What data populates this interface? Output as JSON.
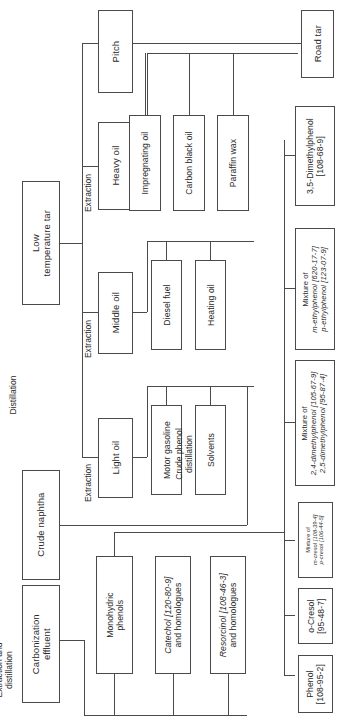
{
  "diagram": {
    "type": "process-flow",
    "orientation": "rotated-90-ccw"
  },
  "nodes": {
    "low_temperature_tar": "Low\ntemperature tar",
    "crude_naphtha": "Crude naphtha",
    "carbonization_effluent": "Carbonization\neffluent",
    "pitch": "Pitch",
    "heavy_oil": "Heavy oil",
    "middle_oil": "Middle oil",
    "light_oil": "Light oil",
    "road_tar": "Road tar",
    "impregnating_oil": "Impregnating oil",
    "carbon_black_oil": "Carbon black oil",
    "paraffin_wax": "Paraffin wax",
    "diesel_fuel": "Diesel fuel",
    "heating_oil": "Heating oil",
    "motor_gasoline": "Motor gasoline",
    "solvents": "Solvents",
    "monohydric_phenols": "Monohydric\nphenols",
    "catechol": "Catechol [120-80-9]\nand homologues",
    "resorcinol": "Resorcinol [108-46-3]\nand homologues",
    "dimethylphenol_35": "3,5-Dimethylphenol\n[108-68-9]",
    "mixture_ethylphenol": "Mixture of\nm-ethylphenol [620-17-7]\np-ethylphenol [123-07-9]",
    "mixture_dimethylphenol": "Mixture of\n2,4-dimethylphenol [105-67-9]\n2,5-dimethylphenol [95-87-4]",
    "mixture_cresol": "Mixture of\nm-cresol [108-39-4]\np-cresol [106-44-5]",
    "o_cresol": "o-Cresol\n[95-48-7]",
    "phenol": "Phenol\n[108-95-2]"
  },
  "node_parts": {
    "catechol": {
      "name": "Catechol",
      "cas": "[120-80-9]",
      "suffix": "and homologues"
    },
    "resorcinol": {
      "name": "Resorcinol",
      "cas": "[108-46-3]",
      "suffix": "and homologues"
    },
    "dimethylphenol_35": {
      "name": "3,5-Dimethylphenol",
      "cas": "[108-68-9]"
    },
    "mixture_ethylphenol": {
      "head": "Mixture of",
      "l1name": "m-ethylphenol",
      "l1cas": "[620-17-7]",
      "l2name": "p-ethylphenol",
      "l2cas": "[123-07-9]"
    },
    "mixture_dimethylphenol": {
      "head": "Mixture of",
      "l1name": "2,4-dimethylphenol",
      "l1cas": "[105-67-9]",
      "l2name": "2,5-dimethylphenol",
      "l2cas": "[95-87-4]"
    },
    "mixture_cresol": {
      "head": "Mixture of",
      "l1name": "m-cresol",
      "l1cas": "[108-39-4]",
      "l2name": "p-cresol",
      "l2cas": "[106-44-5]"
    },
    "o_cresol": {
      "name": "o-Cresol",
      "cas": "[95-48-7]"
    },
    "phenol": {
      "name": "Phenol",
      "cas": "[108-95-2]"
    }
  },
  "process_labels": {
    "distillation": "Distillation",
    "extraction_heavy": "Extraction",
    "extraction_middle": "Extraction",
    "extraction_light": "Extraction",
    "extraction_and_distillation": "Extraction and\ndistillation",
    "crude_phenol_distillation": "Crude phenol\ndistillation"
  },
  "colors": {
    "line": "#4a4a4a",
    "background": "#ffffff",
    "text": "#2b2b2b"
  }
}
